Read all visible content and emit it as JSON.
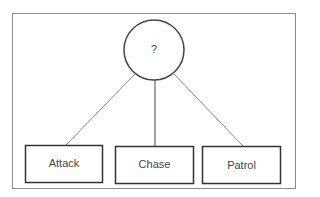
{
  "diagram": {
    "type": "tree",
    "root": {
      "label": "?"
    },
    "children": [
      {
        "label": "Attack"
      },
      {
        "label": "Chase"
      },
      {
        "label": "Patrol"
      }
    ],
    "colors": {
      "stroke": "#333333",
      "frame": "#888888",
      "edge": "#777777",
      "text": "#444444"
    }
  }
}
